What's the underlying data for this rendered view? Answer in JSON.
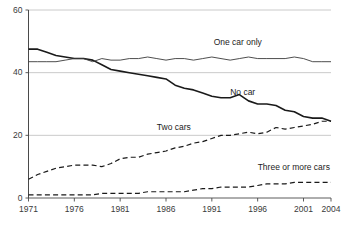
{
  "chart_data": {
    "type": "line",
    "title": "",
    "subtitle": "",
    "xlabel": "",
    "ylabel": "",
    "xlim": [
      1971,
      2004
    ],
    "ylim": [
      0,
      60
    ],
    "yticks": [
      0,
      20,
      40,
      60
    ],
    "ytick_labels": [
      "0",
      "20",
      "40",
      "60"
    ],
    "xticks": [
      1971,
      1976,
      1981,
      1986,
      1991,
      1996,
      2001,
      2004
    ],
    "xtick_labels": [
      "1971",
      "1976",
      "1981",
      "1986",
      "1991",
      "1996",
      "2001",
      "2004"
    ],
    "grid": true,
    "grid_axis": "y",
    "legend_position": "inline-annotations",
    "x": [
      1971,
      1972,
      1973,
      1974,
      1975,
      1976,
      1977,
      1978,
      1979,
      1980,
      1981,
      1982,
      1983,
      1984,
      1985,
      1986,
      1987,
      1988,
      1989,
      1990,
      1991,
      1992,
      1993,
      1994,
      1995,
      1996,
      1997,
      1998,
      1999,
      2000,
      2001,
      2002,
      2003,
      2004
    ],
    "series": [
      {
        "name": "No car",
        "style": "solid",
        "color": "#1a1a1a",
        "width": 1.6,
        "values": [
          47.5,
          47.5,
          46.5,
          45.5,
          45.0,
          44.5,
          44.5,
          44.0,
          42.5,
          41.0,
          40.5,
          40.0,
          39.5,
          39.0,
          38.5,
          38.0,
          36.0,
          35.0,
          34.5,
          33.5,
          32.5,
          32.0,
          32.0,
          33.0,
          31.0,
          30.0,
          30.0,
          29.5,
          28.0,
          27.5,
          26.0,
          25.5,
          25.5,
          24.5
        ]
      },
      {
        "name": "One car only",
        "style": "solid",
        "color": "#3a3a3a",
        "width": 0.9,
        "values": [
          43.5,
          43.5,
          43.5,
          43.5,
          44.0,
          44.5,
          44.5,
          43.5,
          44.5,
          44.0,
          44.0,
          44.5,
          44.5,
          45.0,
          44.5,
          44.0,
          44.5,
          44.5,
          44.0,
          44.5,
          45.0,
          44.5,
          44.0,
          44.5,
          45.0,
          44.5,
          44.5,
          44.5,
          44.5,
          45.0,
          44.5,
          43.5,
          43.5,
          43.5
        ]
      },
      {
        "name": "Two cars",
        "style": "dashed",
        "color": "#1a1a1a",
        "width": 1.2,
        "values": [
          6.0,
          7.5,
          8.5,
          9.5,
          10.0,
          10.5,
          10.5,
          10.5,
          10.0,
          11.0,
          12.5,
          13.0,
          13.0,
          14.0,
          14.5,
          15.0,
          16.0,
          16.5,
          17.5,
          18.0,
          19.0,
          20.0,
          20.0,
          20.5,
          21.0,
          20.5,
          21.0,
          22.5,
          22.0,
          22.5,
          23.0,
          23.5,
          24.5,
          24.5
        ]
      },
      {
        "name": "Three or more cars",
        "style": "dashed",
        "color": "#1a1a1a",
        "width": 1.2,
        "values": [
          1.0,
          1.0,
          1.0,
          1.0,
          1.0,
          1.0,
          1.0,
          1.0,
          1.5,
          1.5,
          1.5,
          1.5,
          1.5,
          2.0,
          2.0,
          2.0,
          2.0,
          2.0,
          2.5,
          3.0,
          3.0,
          3.5,
          3.5,
          3.5,
          3.5,
          4.0,
          4.5,
          4.5,
          4.5,
          5.0,
          5.0,
          5.0,
          5.0,
          5.0
        ]
      }
    ],
    "annotations": [
      {
        "text": "One car only",
        "x": 1991.2,
        "y": 49.5
      },
      {
        "text": "No car",
        "x": 1993.0,
        "y": 33.5
      },
      {
        "text": "Two cars",
        "x": 1985.0,
        "y": 22.5
      },
      {
        "text": "Three or more cars",
        "x": 1996.0,
        "y": 9.5
      }
    ],
    "colors": {
      "axis": "#4a4a4a",
      "grid": "#bdbdbd",
      "text": "#3a3a3a",
      "line_dark": "#1a1a1a",
      "line_thin": "#3a3a3a",
      "background": "#ffffff"
    }
  }
}
